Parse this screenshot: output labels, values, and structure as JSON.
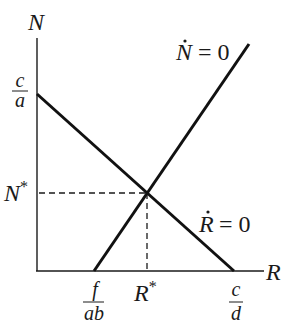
{
  "diagram": {
    "type": "phase-plane",
    "axes": {
      "y_label": "N",
      "x_label": "R"
    },
    "y_ticks": {
      "top_fraction": {
        "num": "c",
        "den": "a"
      },
      "equilibrium": "N",
      "equilibrium_sup": "*"
    },
    "x_ticks": {
      "left_fraction": {
        "num": "f",
        "den": "ab"
      },
      "equilibrium": "R",
      "equilibrium_sup": "*",
      "right_fraction": {
        "num": "c",
        "den": "d"
      }
    },
    "isoclines": [
      {
        "name": "N-dot isocline",
        "var": "N",
        "rhs": "= 0",
        "slope": "positive"
      },
      {
        "name": "R-dot isocline",
        "var": "R",
        "rhs": "= 0",
        "slope": "negative"
      }
    ],
    "colors": {
      "line": "#111111",
      "background": "#ffffff"
    }
  }
}
